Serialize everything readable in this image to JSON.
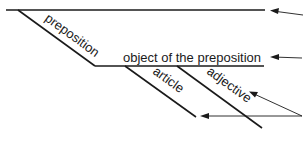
{
  "diagram": {
    "type": "sentence-diagram",
    "labels": {
      "preposition": "preposition",
      "object": "object of the preposition",
      "article": "article",
      "adjective": "adjective"
    },
    "colors": {
      "line": "#1a1a1a",
      "background": "#ffffff"
    }
  }
}
